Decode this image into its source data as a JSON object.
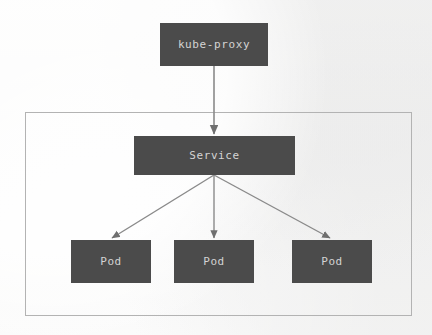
{
  "diagram": {
    "background_color": "#f4f4f3",
    "node_fill_color": "#4b4b4b",
    "node_text_color": "#d4d4d4",
    "edge_color": "#808080",
    "boundary_border_color": "#b3b3b3",
    "nodes": [
      {
        "id": "kube-proxy",
        "label": "kube-proxy",
        "x": 160,
        "y": 23,
        "w": 108,
        "h": 43
      },
      {
        "id": "service",
        "label": "Service",
        "x": 134,
        "y": 136,
        "w": 161,
        "h": 39
      },
      {
        "id": "pod-1",
        "label": "Pod",
        "x": 71,
        "y": 240,
        "w": 80,
        "h": 43
      },
      {
        "id": "pod-2",
        "label": "Pod",
        "x": 174,
        "y": 240,
        "w": 80,
        "h": 43
      },
      {
        "id": "pod-3",
        "label": "Pod",
        "x": 292,
        "y": 240,
        "w": 80,
        "h": 43
      }
    ],
    "boundary": {
      "name": "cluster-boundary",
      "x": 25,
      "y": 112,
      "w": 387,
      "h": 204
    },
    "edges": [
      {
        "from": "kube-proxy",
        "to": "service",
        "arrow": true
      },
      {
        "from": "service",
        "to": "pod-1",
        "arrow": true
      },
      {
        "from": "service",
        "to": "pod-2",
        "arrow": true
      },
      {
        "from": "service",
        "to": "pod-3",
        "arrow": true
      }
    ]
  }
}
